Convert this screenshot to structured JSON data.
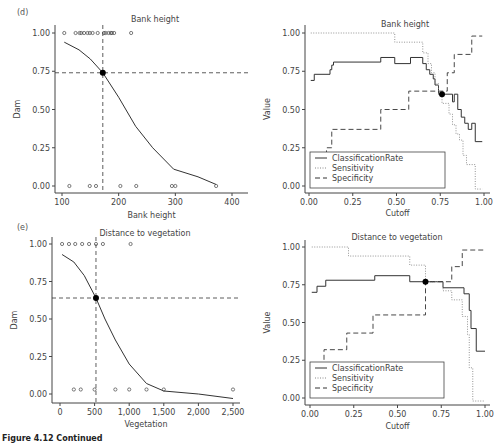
{
  "figure": {
    "caption": "Figure 4.12 Continued"
  },
  "chart_data": [
    {
      "panel": "(d)",
      "type": "scatter",
      "title": "Bank height",
      "xlabel": "Bank height",
      "ylabel": "Dam",
      "xlim": [
        90,
        410
      ],
      "ylim": [
        -0.05,
        1.05
      ],
      "xticks": [
        "100",
        "200",
        "300",
        "400"
      ],
      "yticks": [
        "0.00",
        "0.25",
        "0.50",
        "0.75",
        "1.00"
      ],
      "points_dam_1": [
        104,
        124,
        131,
        134,
        139,
        145,
        149,
        154,
        163,
        174,
        177,
        182,
        186,
        188,
        192,
        222
      ],
      "points_dam_0": [
        113,
        149,
        160,
        203,
        231,
        294,
        300,
        372
      ],
      "fitted_curve": {
        "x": [
          104,
          130,
          150,
          172,
          200,
          230,
          260,
          297,
          340,
          372
        ],
        "y": [
          0.94,
          0.89,
          0.83,
          0.74,
          0.58,
          0.39,
          0.25,
          0.11,
          0.06,
          0.01
        ]
      },
      "cutoff_point": {
        "x": 172,
        "y": 0.74
      },
      "reference_lines": {
        "vertical_x": 172,
        "horizontal_y": 0.74
      }
    },
    {
      "panel": "(d)",
      "type": "line",
      "title": "Bank height",
      "xlabel": "Cutoff",
      "ylabel": "Value",
      "xlim": [
        -0.02,
        1.02
      ],
      "ylim": [
        -0.05,
        1.05
      ],
      "xticks": [
        "0.00",
        "0.25",
        "0.50",
        "0.75",
        "1.00"
      ],
      "yticks": [
        "0.00",
        "0.25",
        "0.50",
        "0.75",
        "1.00"
      ],
      "legend": [
        "ClassificationRate",
        "Sensitivity",
        "Specificity"
      ],
      "legend_position": "lower left",
      "series": [
        {
          "name": "ClassificationRate",
          "style": "solid",
          "x": [
            0.01,
            0.03,
            0.03,
            0.12,
            0.12,
            0.13,
            0.13,
            0.14,
            0.14,
            0.41,
            0.41,
            0.49,
            0.49,
            0.58,
            0.58,
            0.65,
            0.65,
            0.67,
            0.67,
            0.69,
            0.69,
            0.71,
            0.71,
            0.72,
            0.72,
            0.74,
            0.74,
            0.76,
            0.76,
            0.82,
            0.82,
            0.83,
            0.83,
            0.85,
            0.85,
            0.87,
            0.87,
            0.89,
            0.89,
            0.91,
            0.91,
            0.93,
            0.93,
            0.95,
            0.95,
            0.99
          ],
          "y": [
            0.69,
            0.69,
            0.73,
            0.73,
            0.76,
            0.76,
            0.79,
            0.79,
            0.81,
            0.81,
            0.84,
            0.84,
            0.8,
            0.8,
            0.84,
            0.84,
            0.8,
            0.8,
            0.76,
            0.76,
            0.73,
            0.73,
            0.7,
            0.7,
            0.66,
            0.66,
            0.6,
            0.6,
            0.6,
            0.6,
            0.55,
            0.55,
            0.6,
            0.6,
            0.5,
            0.5,
            0.45,
            0.45,
            0.41,
            0.41,
            0.37,
            0.37,
            0.41,
            0.41,
            0.29,
            0.29
          ]
        },
        {
          "name": "Sensitivity",
          "style": "dotted",
          "x": [
            0.01,
            0.49,
            0.49,
            0.65,
            0.65,
            0.68,
            0.68,
            0.7,
            0.7,
            0.72,
            0.72,
            0.74,
            0.74,
            0.76,
            0.76,
            0.8,
            0.8,
            0.82,
            0.82,
            0.84,
            0.84,
            0.86,
            0.86,
            0.88,
            0.88,
            0.9,
            0.9,
            0.91,
            0.91,
            0.95,
            0.95,
            0.99
          ],
          "y": [
            1.0,
            1.0,
            0.94,
            0.94,
            0.87,
            0.87,
            0.8,
            0.8,
            0.74,
            0.74,
            0.67,
            0.67,
            0.6,
            0.6,
            0.54,
            0.54,
            0.47,
            0.47,
            0.4,
            0.4,
            0.34,
            0.34,
            0.3,
            0.3,
            0.2,
            0.2,
            0.14,
            0.14,
            0.14,
            0.14,
            -0.02,
            -0.02
          ]
        },
        {
          "name": "Specificity",
          "style": "dashed",
          "x": [
            0.1,
            0.1,
            0.13,
            0.13,
            0.41,
            0.41,
            0.57,
            0.57,
            0.79,
            0.79,
            0.83,
            0.83,
            0.93,
            0.93,
            0.99
          ],
          "y": [
            0.2,
            0.25,
            0.25,
            0.37,
            0.37,
            0.5,
            0.5,
            0.62,
            0.62,
            0.74,
            0.74,
            0.86,
            0.86,
            0.98,
            0.98
          ]
        }
      ],
      "marker_point": {
        "x": 0.76,
        "y": 0.6
      }
    },
    {
      "panel": "(e)",
      "type": "scatter",
      "title": "Distance to vegetation",
      "xlabel": "Vegetation",
      "ylabel": "Dam",
      "xlim": [
        -100,
        2600
      ],
      "ylim": [
        -0.05,
        1.05
      ],
      "xticks": [
        "0",
        "500",
        "1,000",
        "1,500",
        "2,000",
        "2,500"
      ],
      "yticks": [
        "0.00",
        "0.25",
        "0.50",
        "0.75",
        "1.00"
      ],
      "points_dam_1": [
        30,
        130,
        220,
        320,
        420,
        520,
        620,
        1020
      ],
      "points_dam_0": [
        200,
        300,
        500,
        800,
        1000,
        1250,
        1500,
        2500
      ],
      "fitted_curve": {
        "x": [
          30,
          200,
          350,
          520,
          650,
          800,
          1000,
          1250,
          1500,
          2000,
          2500
        ],
        "y": [
          0.93,
          0.88,
          0.79,
          0.64,
          0.5,
          0.36,
          0.2,
          0.07,
          0.02,
          0.0,
          -0.03
        ]
      },
      "cutoff_point": {
        "x": 520,
        "y": 0.64
      },
      "reference_lines": {
        "vertical_x": 520,
        "horizontal_y": 0.64
      }
    },
    {
      "panel": "(e)",
      "type": "line",
      "title": "Distance to vegetation",
      "xlabel": "Cutoff",
      "ylabel": "Value",
      "xlim": [
        -0.02,
        1.02
      ],
      "ylim": [
        -0.05,
        1.05
      ],
      "xticks": [
        "0.00",
        "0.25",
        "0.50",
        "0.75",
        "1.00"
      ],
      "yticks": [
        "0.00",
        "0.25",
        "0.50",
        "0.75",
        "1.00"
      ],
      "legend": [
        "ClassificationRate",
        "Sensitivity",
        "Specificity"
      ],
      "legend_position": "lower left",
      "series": [
        {
          "name": "ClassificationRate",
          "style": "solid",
          "x": [
            0.01,
            0.04,
            0.04,
            0.09,
            0.09,
            0.37,
            0.37,
            0.57,
            0.57,
            0.66,
            0.66,
            0.76,
            0.76,
            0.88,
            0.88,
            0.91,
            0.91,
            0.92,
            0.92,
            0.95,
            0.95,
            1.0
          ],
          "y": [
            0.7,
            0.7,
            0.74,
            0.74,
            0.78,
            0.78,
            0.81,
            0.81,
            0.77,
            0.77,
            0.77,
            0.77,
            0.73,
            0.73,
            0.69,
            0.69,
            0.58,
            0.58,
            0.46,
            0.46,
            0.31,
            0.31
          ]
        },
        {
          "name": "Sensitivity",
          "style": "dotted",
          "x": [
            0.01,
            0.22,
            0.22,
            0.57,
            0.57,
            0.66,
            0.66,
            0.76,
            0.76,
            0.81,
            0.81,
            0.87,
            0.87,
            0.9,
            0.9,
            0.91,
            0.91,
            0.93,
            0.93,
            1.0
          ],
          "y": [
            1.0,
            1.0,
            0.94,
            0.94,
            0.88,
            0.88,
            0.77,
            0.77,
            0.71,
            0.71,
            0.65,
            0.65,
            0.54,
            0.54,
            0.42,
            0.42,
            0.2,
            0.2,
            -0.02,
            -0.02
          ]
        },
        {
          "name": "Specificity",
          "style": "dashed",
          "x": [
            0.08,
            0.08,
            0.21,
            0.21,
            0.36,
            0.36,
            0.66,
            0.66,
            0.81,
            0.81,
            0.87,
            0.87,
            1.0
          ],
          "y": [
            0.2,
            0.32,
            0.32,
            0.43,
            0.43,
            0.55,
            0.55,
            0.77,
            0.77,
            0.87,
            0.87,
            0.98,
            0.98
          ]
        }
      ],
      "marker_point": {
        "x": 0.66,
        "y": 0.77
      }
    }
  ]
}
